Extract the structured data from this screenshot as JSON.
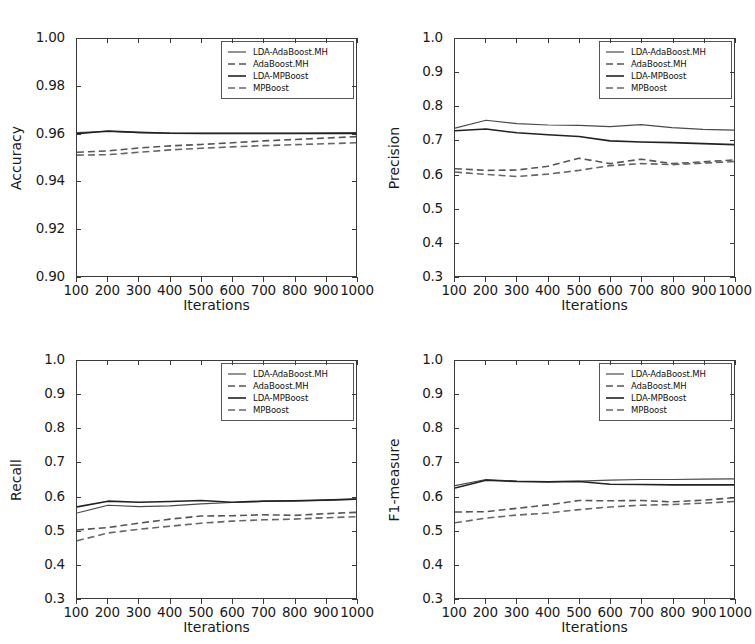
{
  "figure": {
    "layout": "2x2 grid of line charts",
    "background": "#ffffff",
    "line_color": "#333333"
  },
  "series_meta": [
    {
      "name": "LDA-AdaBoost.MH",
      "style": "solid",
      "color": "#4a4a4a",
      "width": 1.2
    },
    {
      "name": "AdaBoost.MH",
      "style": "dashed",
      "color": "#555555",
      "width": 1.6
    },
    {
      "name": "LDA-MPBoost",
      "style": "solid",
      "color": "#222222",
      "width": 1.6
    },
    {
      "name": "MPBoost",
      "style": "dashed",
      "color": "#666666",
      "width": 1.6
    }
  ],
  "chart_data": [
    {
      "id": "accuracy",
      "type": "line",
      "title": "",
      "xlabel": "Iterations",
      "ylabel": "Accuracy",
      "x": [
        100,
        200,
        300,
        400,
        500,
        600,
        700,
        800,
        900,
        1000
      ],
      "xlim": [
        100,
        1000
      ],
      "ylim": [
        0.9,
        1.0
      ],
      "xticks": [
        100,
        200,
        300,
        400,
        500,
        600,
        700,
        800,
        900,
        1000
      ],
      "xticklabels": [
        "100",
        "200",
        "300",
        "400",
        "500",
        "600",
        "700",
        "800",
        "900",
        "1000"
      ],
      "yticks": [
        0.9,
        0.92,
        0.94,
        0.96,
        0.98,
        1.0
      ],
      "yticklabels": [
        "0.90",
        "0.92",
        "0.94",
        "0.96",
        "0.98",
        "1.00"
      ],
      "grid": false,
      "legend_position": "upper right",
      "series": [
        {
          "name": "LDA-AdaBoost.MH",
          "values": [
            0.9605,
            0.961,
            0.9605,
            0.9603,
            0.9603,
            0.9603,
            0.9603,
            0.9603,
            0.9604,
            0.9605
          ]
        },
        {
          "name": "AdaBoost.MH",
          "values": [
            0.9522,
            0.9528,
            0.954,
            0.9549,
            0.9555,
            0.9562,
            0.957,
            0.9576,
            0.9582,
            0.9588
          ]
        },
        {
          "name": "LDA-MPBoost",
          "values": [
            0.96,
            0.9612,
            0.9606,
            0.9602,
            0.9601,
            0.9601,
            0.9601,
            0.9601,
            0.9601,
            0.9601
          ]
        },
        {
          "name": "MPBoost",
          "values": [
            0.951,
            0.9512,
            0.9522,
            0.9532,
            0.9539,
            0.9545,
            0.955,
            0.9554,
            0.9558,
            0.9562
          ]
        }
      ]
    },
    {
      "id": "precision",
      "type": "line",
      "title": "",
      "xlabel": "Iterations",
      "ylabel": "Precision",
      "x": [
        100,
        200,
        300,
        400,
        500,
        600,
        700,
        800,
        900,
        1000
      ],
      "xlim": [
        100,
        1000
      ],
      "ylim": [
        0.3,
        1.0
      ],
      "xticks": [
        100,
        200,
        300,
        400,
        500,
        600,
        700,
        800,
        900,
        1000
      ],
      "xticklabels": [
        "100",
        "200",
        "300",
        "400",
        "500",
        "600",
        "700",
        "800",
        "900",
        "1000"
      ],
      "yticks": [
        0.3,
        0.4,
        0.5,
        0.6,
        0.7,
        0.8,
        0.9,
        1.0
      ],
      "yticklabels": [
        "0.3",
        "0.4",
        "0.5",
        "0.6",
        "0.7",
        "0.8",
        "0.9",
        "1.0"
      ],
      "grid": false,
      "legend_position": "upper right",
      "series": [
        {
          "name": "LDA-AdaBoost.MH",
          "values": [
            0.737,
            0.76,
            0.75,
            0.746,
            0.745,
            0.741,
            0.747,
            0.738,
            0.733,
            0.731
          ]
        },
        {
          "name": "AdaBoost.MH",
          "values": [
            0.617,
            0.612,
            0.613,
            0.624,
            0.648,
            0.632,
            0.645,
            0.632,
            0.637,
            0.643
          ]
        },
        {
          "name": "LDA-MPBoost",
          "values": [
            0.729,
            0.734,
            0.723,
            0.717,
            0.712,
            0.699,
            0.696,
            0.694,
            0.691,
            0.688
          ]
        },
        {
          "name": "MPBoost",
          "values": [
            0.607,
            0.6,
            0.594,
            0.601,
            0.612,
            0.626,
            0.632,
            0.629,
            0.633,
            0.638
          ]
        }
      ]
    },
    {
      "id": "recall",
      "type": "line",
      "title": "",
      "xlabel": "Iterations",
      "ylabel": "Recall",
      "x": [
        100,
        200,
        300,
        400,
        500,
        600,
        700,
        800,
        900,
        1000
      ],
      "xlim": [
        100,
        1000
      ],
      "ylim": [
        0.3,
        1.0
      ],
      "xticks": [
        100,
        200,
        300,
        400,
        500,
        600,
        700,
        800,
        900,
        1000
      ],
      "xticklabels": [
        "100",
        "200",
        "300",
        "400",
        "500",
        "600",
        "700",
        "800",
        "900",
        "1000"
      ],
      "yticks": [
        0.3,
        0.4,
        0.5,
        0.6,
        0.7,
        0.8,
        0.9,
        1.0
      ],
      "yticklabels": [
        "0.3",
        "0.4",
        "0.5",
        "0.6",
        "0.7",
        "0.8",
        "0.9",
        "1.0"
      ],
      "grid": false,
      "legend_position": "upper right",
      "series": [
        {
          "name": "LDA-AdaBoost.MH",
          "values": [
            0.551,
            0.574,
            0.57,
            0.572,
            0.578,
            0.582,
            0.585,
            0.586,
            0.589,
            0.592
          ]
        },
        {
          "name": "AdaBoost.MH",
          "values": [
            0.501,
            0.508,
            0.521,
            0.533,
            0.542,
            0.543,
            0.546,
            0.544,
            0.549,
            0.553
          ]
        },
        {
          "name": "LDA-MPBoost",
          "values": [
            0.569,
            0.586,
            0.583,
            0.585,
            0.588,
            0.583,
            0.586,
            0.587,
            0.589,
            0.592
          ]
        },
        {
          "name": "MPBoost",
          "values": [
            0.469,
            0.492,
            0.503,
            0.512,
            0.521,
            0.527,
            0.531,
            0.533,
            0.537,
            0.54
          ]
        }
      ]
    },
    {
      "id": "f1",
      "type": "line",
      "title": "",
      "xlabel": "Iterations",
      "ylabel": "F1-measure",
      "x": [
        100,
        200,
        300,
        400,
        500,
        600,
        700,
        800,
        900,
        1000
      ],
      "xlim": [
        100,
        1000
      ],
      "ylim": [
        0.3,
        1.0
      ],
      "xticks": [
        100,
        200,
        300,
        400,
        500,
        600,
        700,
        800,
        900,
        1000
      ],
      "xticklabels": [
        "100",
        "200",
        "300",
        "400",
        "500",
        "600",
        "700",
        "800",
        "900",
        "1000"
      ],
      "yticks": [
        0.3,
        0.4,
        0.5,
        0.6,
        0.7,
        0.8,
        0.9,
        1.0
      ],
      "yticklabels": [
        "0.3",
        "0.4",
        "0.5",
        "0.6",
        "0.7",
        "0.8",
        "0.9",
        "1.0"
      ],
      "grid": false,
      "legend_position": "upper right",
      "series": [
        {
          "name": "LDA-AdaBoost.MH",
          "values": [
            0.632,
            0.65,
            0.645,
            0.644,
            0.645,
            0.648,
            0.65,
            0.65,
            0.651,
            0.652
          ]
        },
        {
          "name": "AdaBoost.MH",
          "values": [
            0.554,
            0.555,
            0.565,
            0.575,
            0.588,
            0.587,
            0.588,
            0.584,
            0.589,
            0.596
          ]
        },
        {
          "name": "LDA-MPBoost",
          "values": [
            0.625,
            0.648,
            0.644,
            0.643,
            0.644,
            0.636,
            0.635,
            0.634,
            0.634,
            0.634
          ]
        },
        {
          "name": "MPBoost",
          "values": [
            0.522,
            0.536,
            0.545,
            0.551,
            0.561,
            0.569,
            0.574,
            0.576,
            0.58,
            0.585
          ]
        }
      ]
    }
  ]
}
